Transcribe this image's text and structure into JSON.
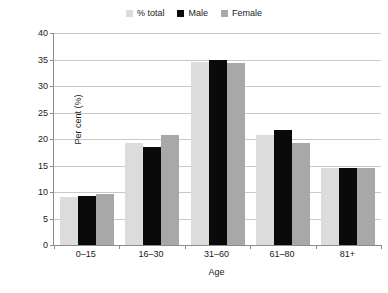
{
  "chart_data": {
    "type": "bar",
    "title": "",
    "subtitle": "",
    "xlabel": "Age",
    "ylabel": "Per cent (%)",
    "categories": [
      "0–15",
      "16–30",
      "31–60",
      "61–80",
      "81+"
    ],
    "series": [
      {
        "name": "% total",
        "color": "#dcdcdc",
        "values": [
          9.1,
          19.3,
          34.6,
          20.8,
          14.6
        ]
      },
      {
        "name": "Male",
        "color": "#0a0a0a",
        "values": [
          9.3,
          18.4,
          35.0,
          21.7,
          14.5
        ]
      },
      {
        "name": "Female",
        "color": "#a8a8a8",
        "values": [
          9.6,
          20.8,
          34.4,
          19.2,
          14.5
        ]
      }
    ],
    "ylim": [
      0,
      40
    ],
    "yticks": [
      0,
      5,
      10,
      15,
      20,
      25,
      30,
      35,
      40
    ],
    "ytick_labels": [
      "0",
      "5",
      "10",
      "15",
      "20",
      "25",
      "30",
      "35",
      "40"
    ],
    "grid": true,
    "grid_axis": "y",
    "legend_position": "top-center",
    "axis_color": "#8c8c8c",
    "grid_color": "#c9c9c9",
    "background": "#ffffff"
  }
}
